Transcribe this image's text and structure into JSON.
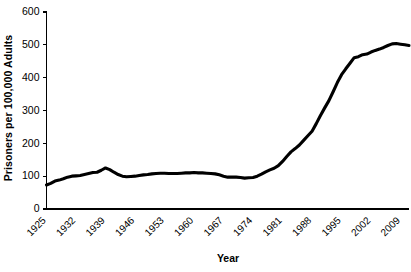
{
  "chart_data": {
    "type": "line",
    "title": "",
    "xlabel": "Year",
    "ylabel": "Prisoners per 100,000 Adults",
    "xlim": [
      1925,
      2011
    ],
    "ylim": [
      0,
      600
    ],
    "grid": false,
    "legend": null,
    "yticks": [
      0,
      100,
      200,
      300,
      400,
      500,
      600
    ],
    "ytick_labels": [
      "0",
      "100",
      "200",
      "300",
      "400",
      "500",
      "600"
    ],
    "xticks": [
      1925,
      1932,
      1939,
      1946,
      1953,
      1960,
      1967,
      1974,
      1981,
      1988,
      1995,
      2002,
      2009
    ],
    "xtick_labels": [
      "1925",
      "1932",
      "1939",
      "1946",
      "1953",
      "1960",
      "1967",
      "1974",
      "1981",
      "1988",
      "1995",
      "2002",
      "2009"
    ],
    "series": [
      {
        "name": "Incarceration rate",
        "color": "#000000",
        "x": [
          1925,
          1926,
          1927,
          1928,
          1929,
          1930,
          1931,
          1932,
          1933,
          1934,
          1935,
          1936,
          1937,
          1938,
          1939,
          1940,
          1941,
          1942,
          1943,
          1944,
          1945,
          1946,
          1947,
          1948,
          1949,
          1950,
          1951,
          1952,
          1953,
          1954,
          1955,
          1956,
          1957,
          1958,
          1959,
          1960,
          1961,
          1962,
          1963,
          1964,
          1965,
          1966,
          1967,
          1968,
          1969,
          1970,
          1971,
          1972,
          1973,
          1974,
          1975,
          1976,
          1977,
          1978,
          1979,
          1980,
          1981,
          1982,
          1983,
          1984,
          1985,
          1986,
          1987,
          1988,
          1989,
          1990,
          1991,
          1992,
          1993,
          1994,
          1995,
          1996,
          1997,
          1998,
          1999,
          2000,
          2001,
          2002,
          2003,
          2004,
          2005,
          2006,
          2007,
          2008,
          2009,
          2010,
          2011
        ],
        "y": [
          73,
          78,
          85,
          88,
          92,
          97,
          100,
          101,
          102,
          105,
          108,
          111,
          112,
          118,
          125,
          120,
          112,
          105,
          100,
          98,
          99,
          100,
          102,
          104,
          105,
          107,
          108,
          109,
          109,
          108,
          108,
          108,
          109,
          110,
          110,
          111,
          110,
          110,
          109,
          108,
          107,
          104,
          100,
          97,
          97,
          97,
          96,
          94,
          95,
          96,
          100,
          106,
          113,
          119,
          124,
          132,
          145,
          160,
          174,
          184,
          195,
          209,
          223,
          237,
          260,
          285,
          308,
          330,
          357,
          385,
          409,
          427,
          444,
          461,
          464,
          470,
          472,
          478,
          483,
          487,
          492,
          498,
          503,
          504,
          502,
          500,
          498
        ]
      }
    ]
  }
}
